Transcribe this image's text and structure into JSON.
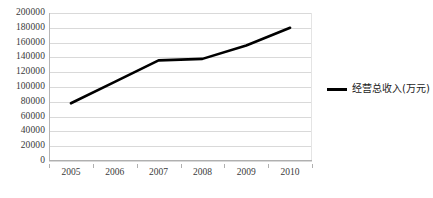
{
  "chart_data": {
    "type": "line",
    "title": "",
    "xlabel": "",
    "ylabel": "",
    "categories": [
      "2005",
      "2006",
      "2007",
      "2008",
      "2009",
      "2010"
    ],
    "series": [
      {
        "name": "经营总收入(万元)",
        "color": "#000000",
        "values": [
          78000,
          107000,
          136000,
          138000,
          156000,
          180000
        ]
      }
    ],
    "ylim": [
      0,
      200000
    ],
    "ytick_step": 20000,
    "yticks": [
      0,
      20000,
      40000,
      60000,
      80000,
      100000,
      120000,
      140000,
      160000,
      180000,
      200000
    ],
    "ytick_labels": [
      "0",
      "20000",
      "40000",
      "60000",
      "80000",
      "100000",
      "120000",
      "140000",
      "160000",
      "180000",
      "200000"
    ],
    "grid": true,
    "grid_axis": "y",
    "legend_position": "right",
    "legend_entries": [
      "经营总收入(万元)"
    ]
  }
}
